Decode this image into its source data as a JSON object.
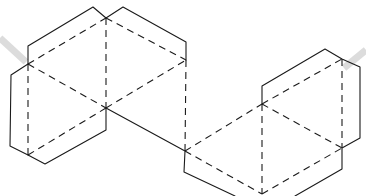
{
  "diagram": {
    "type": "net-of-solid",
    "colors": {
      "line": "#1a1a1a",
      "background": "#ffffff",
      "shadow_band": "#dcdcdc"
    },
    "solid_edges": [
      [
        [
          28,
          64
        ],
        [
          11,
          75
        ],
        [
          10,
          146
        ],
        [
          28,
          155
        ]
      ],
      [
        [
          28,
          155
        ],
        [
          45,
          164
        ],
        [
          106,
          130
        ],
        [
          106,
          108
        ]
      ],
      [
        [
          28,
          64
        ],
        [
          28,
          46
        ],
        [
          93,
          7
        ],
        [
          106,
          18
        ],
        [
          123,
          7
        ],
        [
          186,
          42
        ],
        [
          186,
          60
        ]
      ],
      [
        [
          106,
          108
        ],
        [
          185,
          151
        ],
        [
          184,
          172
        ],
        [
          235,
          196
        ]
      ],
      [
        [
          262,
          104
        ],
        [
          262,
          86
        ],
        [
          325,
          49
        ],
        [
          342,
          59
        ],
        [
          360,
          67
        ],
        [
          360,
          138
        ],
        [
          342,
          148
        ],
        [
          342,
          169
        ],
        [
          295,
          196
        ]
      ]
    ],
    "dashed_edges": [
      [
        [
          28,
          64
        ],
        [
          28,
          155
        ]
      ],
      [
        [
          28,
          64
        ],
        [
          106,
          18
        ]
      ],
      [
        [
          106,
          18
        ],
        [
          106,
          108
        ]
      ],
      [
        [
          28,
          64
        ],
        [
          106,
          108
        ]
      ],
      [
        [
          28,
          155
        ],
        [
          106,
          108
        ]
      ],
      [
        [
          106,
          108
        ],
        [
          186,
          60
        ]
      ],
      [
        [
          106,
          18
        ],
        [
          186,
          60
        ]
      ],
      [
        [
          186,
          60
        ],
        [
          185,
          151
        ]
      ],
      [
        [
          185,
          151
        ],
        [
          262,
          104
        ]
      ],
      [
        [
          185,
          151
        ],
        [
          262,
          194
        ]
      ],
      [
        [
          262,
          104
        ],
        [
          262,
          194
        ]
      ],
      [
        [
          262,
          104
        ],
        [
          342,
          59
        ]
      ],
      [
        [
          262,
          104
        ],
        [
          342,
          148
        ]
      ],
      [
        [
          342,
          59
        ],
        [
          342,
          148
        ]
      ],
      [
        [
          262,
          194
        ],
        [
          342,
          148
        ]
      ]
    ],
    "shadow_bands": [
      [
        [
          0,
          38
        ],
        [
          26,
          62
        ]
      ],
      [
        [
          344,
          68
        ],
        [
          366,
          50
        ]
      ]
    ]
  }
}
